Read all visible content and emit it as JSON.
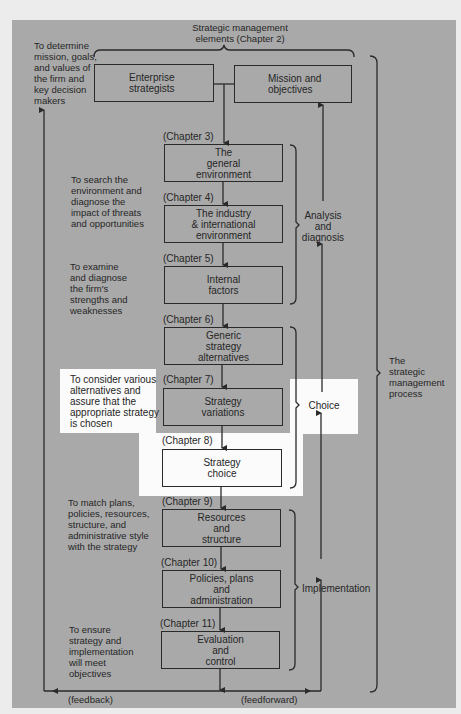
{
  "header": {
    "title": "Strategic management\nelements (Chapter 2)"
  },
  "top_boxes": {
    "enterprise": "Enterprise\nstrategists",
    "mission": "Mission and\nobjectives"
  },
  "steps": [
    {
      "chapter": "(Chapter 3)",
      "label": "The\ngeneral\nenvironment"
    },
    {
      "chapter": "(Chapter 4)",
      "label": "The industry\n& international\nenvironment"
    },
    {
      "chapter": "(Chapter 5)",
      "label": "Internal\nfactors"
    },
    {
      "chapter": "(Chapter 6)",
      "label": "Generic\nstrategy\nalternatives"
    },
    {
      "chapter": "(Chapter 7)",
      "label": "Strategy\nvariations"
    },
    {
      "chapter": "(Chapter 8)",
      "label": "Strategy\nchoice"
    },
    {
      "chapter": "(Chapter 9)",
      "label": "Resources\nand\nstructure"
    },
    {
      "chapter": "(Chapter 10)",
      "label": "Policies, plans\nand\nadministration"
    },
    {
      "chapter": "(Chapter 11)",
      "label": "Evaluation\nand\ncontrol"
    }
  ],
  "descriptions": {
    "mission": "To determine\nmission, goals,\nand values of\nthe firm and\nkey decision\nmakers",
    "environment": "To search the\nenvironment and\ndiagnose the\nimpact of threats\nand opportunities",
    "internal": "To examine\nand diagnose\nthe firm's\nstrengths and\nweaknesses",
    "choice": "To consider various\nalternatives and\nassure that the\nappropriate strategy\nis chosen",
    "implementation": "To match plans,\npolicies, resources,\nstructure, and\nadministrative style\nwith the strategy",
    "evaluation": "To ensure\nstrategy and\nimplementation\nwill meet\nobjectives"
  },
  "phases": {
    "analysis": "Analysis\nand\ndiagnosis",
    "choice": "Choice",
    "implementation": "Implementation",
    "process": "The\nstrategic\nmanagement\nprocess"
  },
  "flow_labels": {
    "feedback": "(feedback)",
    "feedforward": "(feedforward)"
  },
  "colors": {
    "panel": "#a9a9a9",
    "highlight": "#fbfbfb",
    "line": "#2a2a2a"
  }
}
